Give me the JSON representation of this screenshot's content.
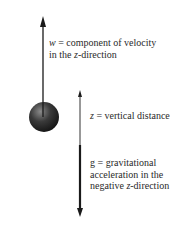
{
  "diagram": {
    "type": "physics-free-body",
    "colors": {
      "background": "#ffffff",
      "arrow": "#1a1a1a",
      "ball_dark": "#151515",
      "ball_light": "#8a8a8a",
      "text": "#2a2a2a"
    },
    "objects": {
      "ball": {
        "name": "sphere",
        "cx": 44,
        "cy": 117,
        "r": 15
      },
      "velocity_arrow": {
        "from": [
          43,
          117
        ],
        "to": [
          43,
          17
        ],
        "direction": "up"
      },
      "axis_arrow": {
        "x": 80,
        "top": 91,
        "split": 145,
        "bottom": 216
      }
    },
    "labels": {
      "w": {
        "line1_var": "w",
        "line1_rest": " = component of velocity",
        "line2_pre": "in the ",
        "line2_var": "z",
        "line2_rest": "-direction"
      },
      "z": {
        "var": "z",
        "rest": " = vertical distance"
      },
      "g": {
        "line1": "g = gravitational",
        "line2": "acceleration in the",
        "line3_pre": "negative ",
        "line3_var": "z",
        "line3_rest": "-direction"
      }
    }
  }
}
